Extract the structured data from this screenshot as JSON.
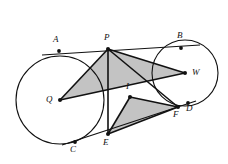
{
  "figure": {
    "type": "geometry-diagram",
    "width": 228,
    "height": 164,
    "background_color": "#ffffff",
    "stroke_color": "#111111",
    "shade_fill_color": "#b8b8b8",
    "shade_opacity": 0.85
  },
  "circles": [
    {
      "name": "circle-Q",
      "center_label": "Q",
      "cx": 60,
      "cy": 100,
      "r": 44
    },
    {
      "name": "circle-W",
      "center_label": "W",
      "cx": 185,
      "cy": 73,
      "r": 33
    }
  ],
  "points": [
    {
      "id": "A",
      "label": "A",
      "x": 59,
      "y": 51,
      "label_x": 53,
      "label_y": 35,
      "dot": true
    },
    {
      "id": "B",
      "label": "B",
      "x": 181,
      "y": 48,
      "label_x": 177,
      "label_y": 31,
      "dot": true
    },
    {
      "id": "P",
      "label": "P",
      "x": 108,
      "y": 49,
      "label_x": 104,
      "label_y": 33,
      "dot": true
    },
    {
      "id": "Q",
      "label": "Q",
      "x": 60,
      "y": 100,
      "label_x": 46,
      "label_y": 95,
      "dot": true
    },
    {
      "id": "W",
      "label": "W",
      "x": 185,
      "y": 73,
      "label_x": 192,
      "label_y": 68,
      "dot": true
    },
    {
      "id": "C",
      "label": "C",
      "x": 75,
      "y": 142,
      "label_x": 70,
      "label_y": 145,
      "dot": true
    },
    {
      "id": "E",
      "label": "E",
      "x": 108,
      "y": 134,
      "label_x": 103,
      "label_y": 138,
      "dot": true
    },
    {
      "id": "I",
      "label": "I",
      "x": 130,
      "y": 97,
      "label_x": 126,
      "label_y": 82,
      "dot": true
    },
    {
      "id": "F",
      "label": "F",
      "x": 178,
      "y": 107,
      "label_x": 174,
      "label_y": 110,
      "dot": true
    },
    {
      "id": "D",
      "label": "D",
      "x": 188,
      "y": 103,
      "label_x": 187,
      "label_y": 104,
      "dot": true
    }
  ],
  "segments": [
    {
      "name": "tangent-A-P-B",
      "from": "A",
      "to": "B",
      "note": "upper external tangent through P"
    },
    {
      "name": "tangent-C-E-F-D",
      "from": "C",
      "to": "D",
      "note": "lower external tangent through E and F"
    },
    {
      "name": "radius-Q-P",
      "from": "Q",
      "to": "P"
    },
    {
      "name": "chord-Q-W",
      "from": "Q",
      "to": "W"
    },
    {
      "name": "segment-P-W",
      "from": "P",
      "to": "W"
    },
    {
      "name": "segment-P-E",
      "from": "P",
      "to": "E"
    },
    {
      "name": "segment-P-F",
      "from": "P",
      "to": "F"
    },
    {
      "name": "segment-I-E",
      "from": "I",
      "to": "E"
    },
    {
      "name": "segment-I-F",
      "from": "I",
      "to": "F"
    },
    {
      "name": "segment-E-F",
      "from": "E",
      "to": "F"
    }
  ],
  "shaded_triangles": [
    {
      "name": "triangle-Q-P-W",
      "vertices": [
        "Q",
        "P",
        "W"
      ]
    },
    {
      "name": "triangle-I-E-F",
      "vertices": [
        "I",
        "E",
        "F"
      ]
    }
  ]
}
